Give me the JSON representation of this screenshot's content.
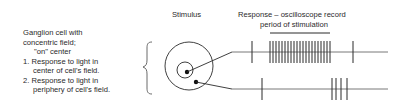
{
  "labels": {
    "cell_title_line1": "Ganglion cell with",
    "cell_title_line2": "concentric field;",
    "cell_title_line3": "\"on\" center",
    "item1_line1": "1. Response to light in",
    "item1_line2": "center of cell's field.",
    "item2_line1": "2. Response to light in",
    "item2_line2": "periphery of cell's field.",
    "stimulus_header": "Stimulus",
    "response_header": "Response – oscilloscope record",
    "stimulation_period_label": "period of stimulation"
  },
  "diagram": {
    "stroke_color": "#2a2a2a",
    "receptive_field": {
      "outer_circle": {
        "cx": 189,
        "cy": 66,
        "r": 24
      },
      "inner_circle": {
        "cx": 185,
        "cy": 70,
        "r": 8
      },
      "center_dot": {
        "cx": 187,
        "cy": 72,
        "r": 2.2
      },
      "periphery_dot": {
        "cx": 196,
        "cy": 82,
        "r": 2.2
      }
    },
    "stimulation_bar": {
      "x1": 270,
      "x2": 330,
      "y": 33
    },
    "traces": [
      {
        "name": "center-response",
        "y": 52,
        "x_start": 232,
        "x_end": 388,
        "spikes": [
          252,
          270,
          273,
          276,
          279,
          282,
          285,
          288,
          291,
          294,
          297,
          300,
          303,
          306,
          309,
          312,
          315,
          318,
          321,
          324,
          327,
          330,
          353
        ],
        "spike_half_height": 11
      },
      {
        "name": "periphery-response",
        "y": 89,
        "x_start": 232,
        "x_end": 388,
        "spikes": [
          262,
          332,
          336,
          341,
          347
        ],
        "spike_half_height": 11
      }
    ]
  }
}
